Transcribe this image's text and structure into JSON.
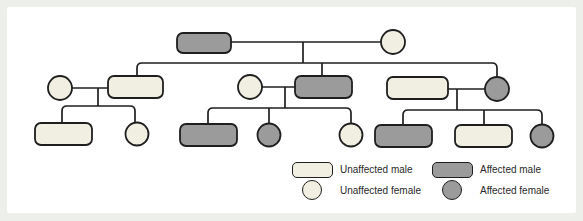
{
  "figure": {
    "kind": "pedigree-chart",
    "colors": {
      "page_bg": "#edefeb",
      "panel_bg": "#ffffff",
      "outline": "#1f1f1f",
      "unaffected_fill": "#f1efe2",
      "affected_fill": "#9b9b9b"
    },
    "members": [
      {
        "id": "I-1",
        "generation": "I",
        "sex": "male",
        "status": "affected",
        "shape": "rect",
        "x": 177,
        "y": 33,
        "w": 54,
        "h": 20
      },
      {
        "id": "I-2",
        "generation": "I",
        "sex": "female",
        "status": "unaffected",
        "shape": "circle",
        "cx": 393,
        "cy": 42,
        "r": 12
      },
      {
        "id": "II-1",
        "generation": "II",
        "sex": "female",
        "status": "unaffected",
        "shape": "circle",
        "cx": 60,
        "cy": 88,
        "r": 12
      },
      {
        "id": "II-2",
        "generation": "II",
        "sex": "male",
        "status": "unaffected",
        "shape": "rect",
        "x": 108,
        "y": 76,
        "w": 55,
        "h": 22
      },
      {
        "id": "II-3",
        "generation": "II",
        "sex": "female",
        "status": "unaffected",
        "shape": "circle",
        "cx": 250,
        "cy": 87,
        "r": 12
      },
      {
        "id": "II-4",
        "generation": "II",
        "sex": "male",
        "status": "affected",
        "shape": "rect",
        "x": 295,
        "y": 76,
        "w": 57,
        "h": 22
      },
      {
        "id": "II-5",
        "generation": "II",
        "sex": "male",
        "status": "unaffected",
        "shape": "rect",
        "x": 387,
        "y": 77,
        "w": 61,
        "h": 22
      },
      {
        "id": "II-6",
        "generation": "II",
        "sex": "female",
        "status": "affected",
        "shape": "circle",
        "cx": 497,
        "cy": 89,
        "r": 12
      },
      {
        "id": "III-1",
        "generation": "III",
        "sex": "male",
        "status": "unaffected",
        "shape": "rect",
        "x": 35,
        "y": 123,
        "w": 57,
        "h": 22
      },
      {
        "id": "III-2",
        "generation": "III",
        "sex": "female",
        "status": "unaffected",
        "shape": "circle",
        "cx": 137,
        "cy": 134,
        "r": 11.5
      },
      {
        "id": "III-3",
        "generation": "III",
        "sex": "male",
        "status": "affected",
        "shape": "rect",
        "x": 180,
        "y": 124,
        "w": 57,
        "h": 22
      },
      {
        "id": "III-4",
        "generation": "III",
        "sex": "female",
        "status": "affected",
        "shape": "circle",
        "cx": 269,
        "cy": 135,
        "r": 11.5
      },
      {
        "id": "III-5",
        "generation": "III",
        "sex": "female",
        "status": "unaffected",
        "shape": "circle",
        "cx": 351,
        "cy": 135,
        "r": 11.5
      },
      {
        "id": "III-6",
        "generation": "III",
        "sex": "male",
        "status": "affected",
        "shape": "rect",
        "x": 375,
        "y": 125,
        "w": 57,
        "h": 22
      },
      {
        "id": "III-7",
        "generation": "III",
        "sex": "male",
        "status": "unaffected",
        "shape": "rect",
        "x": 455,
        "y": 125,
        "w": 57,
        "h": 22
      },
      {
        "id": "III-8",
        "generation": "III",
        "sex": "female",
        "status": "affected",
        "shape": "circle",
        "cx": 542,
        "cy": 136,
        "r": 11.5
      }
    ],
    "connectors": [
      {
        "name": "gen1-marriage-line",
        "path": "M231,42 H381"
      },
      {
        "name": "gen1-descent-line",
        "path": "M303,42 V63"
      },
      {
        "name": "gen2-sibship-line",
        "path": "M137,76 V68 Q137,63 142,63 H492 Q497,63 497,68 V77"
      },
      {
        "name": "gen2-drop-to-II-4",
        "path": "M322,63 V76"
      },
      {
        "name": "left-marriage-line",
        "path": "M72,88 H108"
      },
      {
        "name": "left-descent-line",
        "path": "M98,88 V106"
      },
      {
        "name": "left-sibship-line",
        "path": "M62,123 V111 Q62,106 67,106 H130 Q135,106 135,111 V123"
      },
      {
        "name": "middle-marriage-line",
        "path": "M262,87 H295"
      },
      {
        "name": "middle-descent-line",
        "path": "M285,87 V108"
      },
      {
        "name": "middle-sibship-line",
        "path": "M208,124 V113 Q208,108 213,108 H346 Q351,108 351,113 V124"
      },
      {
        "name": "middle-drop-to-III-4",
        "path": "M269,108 V124"
      },
      {
        "name": "right-marriage-line",
        "path": "M448,89 H485"
      },
      {
        "name": "right-descent-line",
        "path": "M457,89 V110"
      },
      {
        "name": "right-sibship-line",
        "path": "M403,125 V115 Q403,110 408,110 H537 Q542,110 542,115 V125"
      },
      {
        "name": "right-drop-to-III-7",
        "path": "M484,110 V125"
      }
    ],
    "legend": {
      "unaffected_male": "Unaffected male",
      "unaffected_female": "Unaffected female",
      "affected_male": "Affected male",
      "affected_female": "Affected female"
    }
  }
}
